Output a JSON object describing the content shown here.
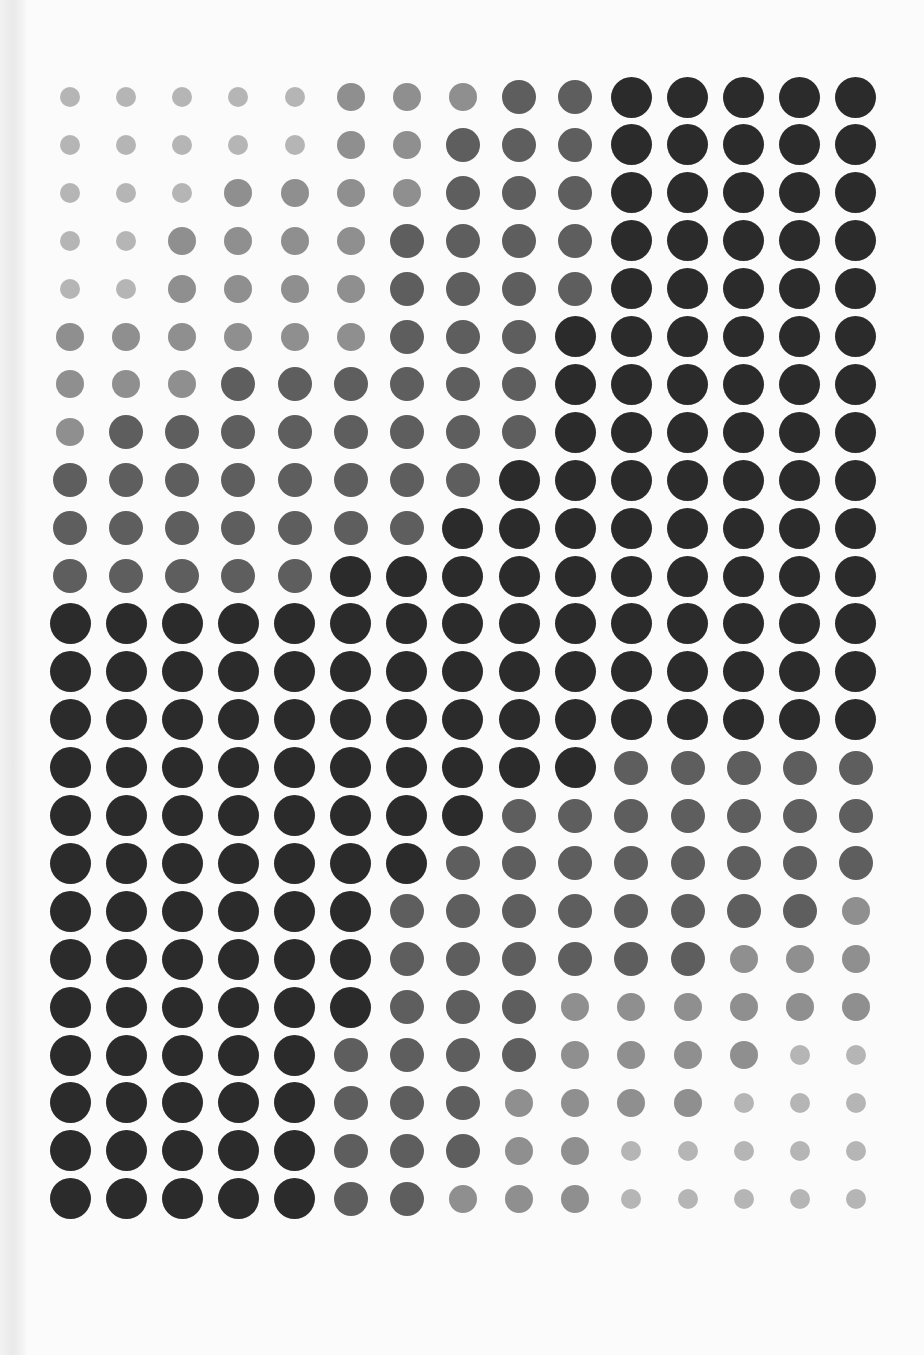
{
  "artwork": {
    "kind": "halftone dot grid",
    "columns": 15,
    "rows": 24,
    "origin": {
      "x": 70,
      "y": 97
    },
    "spacing": {
      "x": 56.14,
      "y": 47.9
    },
    "levels": [
      {
        "id": 0,
        "name": "small-light",
        "diameter": 20,
        "color": "#b5b5b5"
      },
      {
        "id": 1,
        "name": "light-medium",
        "diameter": 28,
        "color": "#8f8f8f"
      },
      {
        "id": 2,
        "name": "medium-dark",
        "diameter": 34,
        "color": "#5e5e5e"
      },
      {
        "id": 3,
        "name": "large-black",
        "diameter": 41,
        "color": "#2b2b2b"
      }
    ],
    "grid": [
      [
        0,
        0,
        0,
        0,
        0,
        1,
        1,
        1,
        2,
        2,
        3,
        3,
        3,
        3,
        3
      ],
      [
        0,
        0,
        0,
        0,
        0,
        1,
        1,
        2,
        2,
        2,
        3,
        3,
        3,
        3,
        3
      ],
      [
        0,
        0,
        0,
        1,
        1,
        1,
        1,
        2,
        2,
        2,
        3,
        3,
        3,
        3,
        3
      ],
      [
        0,
        0,
        1,
        1,
        1,
        1,
        2,
        2,
        2,
        2,
        3,
        3,
        3,
        3,
        3
      ],
      [
        0,
        0,
        1,
        1,
        1,
        1,
        2,
        2,
        2,
        2,
        3,
        3,
        3,
        3,
        3
      ],
      [
        1,
        1,
        1,
        1,
        1,
        1,
        2,
        2,
        2,
        3,
        3,
        3,
        3,
        3,
        3
      ],
      [
        1,
        1,
        1,
        2,
        2,
        2,
        2,
        2,
        2,
        3,
        3,
        3,
        3,
        3,
        3
      ],
      [
        1,
        2,
        2,
        2,
        2,
        2,
        2,
        2,
        2,
        3,
        3,
        3,
        3,
        3,
        3
      ],
      [
        2,
        2,
        2,
        2,
        2,
        2,
        2,
        2,
        3,
        3,
        3,
        3,
        3,
        3,
        3
      ],
      [
        2,
        2,
        2,
        2,
        2,
        2,
        2,
        3,
        3,
        3,
        3,
        3,
        3,
        3,
        3
      ],
      [
        2,
        2,
        2,
        2,
        2,
        3,
        3,
        3,
        3,
        3,
        3,
        3,
        3,
        3,
        3
      ],
      [
        3,
        3,
        3,
        3,
        3,
        3,
        3,
        3,
        3,
        3,
        3,
        3,
        3,
        3,
        3
      ],
      [
        3,
        3,
        3,
        3,
        3,
        3,
        3,
        3,
        3,
        3,
        3,
        3,
        3,
        3,
        3
      ],
      [
        3,
        3,
        3,
        3,
        3,
        3,
        3,
        3,
        3,
        3,
        3,
        3,
        3,
        3,
        3
      ],
      [
        3,
        3,
        3,
        3,
        3,
        3,
        3,
        3,
        3,
        3,
        2,
        2,
        2,
        2,
        2
      ],
      [
        3,
        3,
        3,
        3,
        3,
        3,
        3,
        3,
        2,
        2,
        2,
        2,
        2,
        2,
        2
      ],
      [
        3,
        3,
        3,
        3,
        3,
        3,
        3,
        2,
        2,
        2,
        2,
        2,
        2,
        2,
        2
      ],
      [
        3,
        3,
        3,
        3,
        3,
        3,
        2,
        2,
        2,
        2,
        2,
        2,
        2,
        2,
        1
      ],
      [
        3,
        3,
        3,
        3,
        3,
        3,
        2,
        2,
        2,
        2,
        2,
        2,
        1,
        1,
        1
      ],
      [
        3,
        3,
        3,
        3,
        3,
        3,
        2,
        2,
        2,
        1,
        1,
        1,
        1,
        1,
        1
      ],
      [
        3,
        3,
        3,
        3,
        3,
        2,
        2,
        2,
        2,
        1,
        1,
        1,
        1,
        0,
        0
      ],
      [
        3,
        3,
        3,
        3,
        3,
        2,
        2,
        2,
        1,
        1,
        1,
        1,
        0,
        0,
        0
      ],
      [
        3,
        3,
        3,
        3,
        3,
        2,
        2,
        2,
        1,
        1,
        0,
        0,
        0,
        0,
        0
      ],
      [
        3,
        3,
        3,
        3,
        3,
        2,
        2,
        1,
        1,
        1,
        0,
        0,
        0,
        0,
        0
      ]
    ]
  }
}
